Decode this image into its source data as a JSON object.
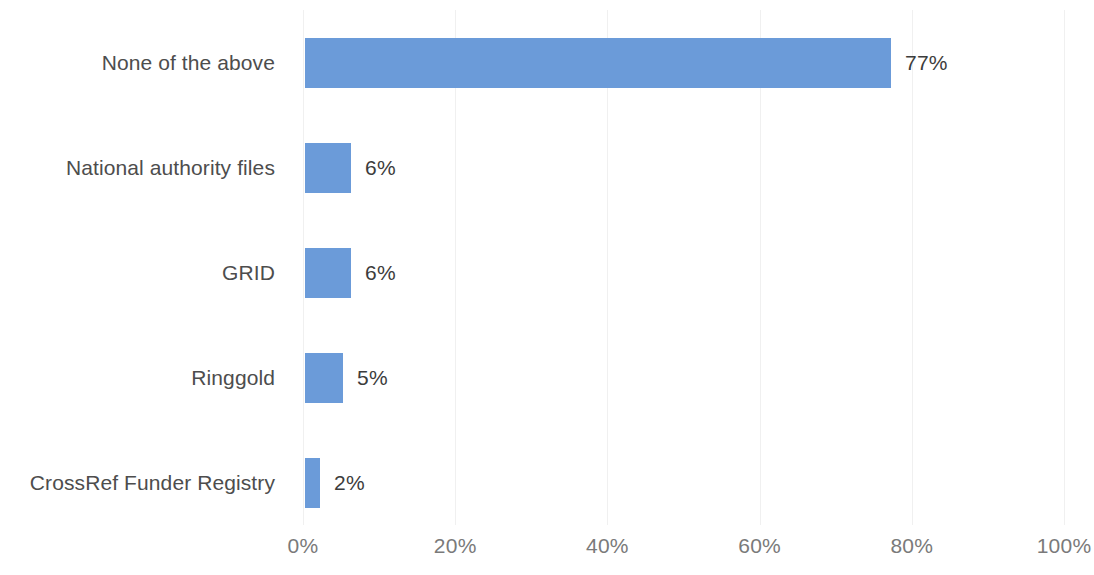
{
  "chart_data": {
    "type": "bar",
    "orientation": "horizontal",
    "title": "",
    "subtitle": "",
    "xlabel": "",
    "ylabel": "",
    "categories": [
      "None of the above",
      "National authority files",
      "GRID",
      "Ringgold",
      "CrossRef Funder Registry"
    ],
    "values": [
      77,
      6,
      6,
      5,
      2
    ],
    "value_labels": [
      "77%",
      "6%",
      "6%",
      "5%",
      "2%"
    ],
    "xlim": [
      0,
      100
    ],
    "xticks": [
      0,
      20,
      40,
      60,
      80,
      100
    ],
    "xtick_labels": [
      "0%",
      "20%",
      "40%",
      "60%",
      "80%",
      "100%"
    ],
    "grid": true,
    "grid_axis": "x",
    "legend": false,
    "legend_position": "none",
    "bar_color": "#6b9bd9",
    "value_label_color": "#3c3c3c",
    "category_label_color": "#4d4d4d",
    "tick_label_color": "#7a7a7a",
    "gridline_color": "#f0f0f0",
    "background_color": "#ffffff"
  }
}
